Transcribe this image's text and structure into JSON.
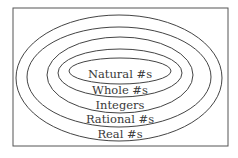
{
  "diagram": {
    "colors": {
      "stroke": "#444444",
      "text": "#3a3a3a",
      "background": "#ffffff"
    },
    "sets": [
      {
        "id": "natural",
        "label": "Natural #s"
      },
      {
        "id": "whole",
        "label": "Whole #s"
      },
      {
        "id": "integers",
        "label": "Integers"
      },
      {
        "id": "rational",
        "label": "Rational #s"
      },
      {
        "id": "real",
        "label": "Real #s"
      }
    ]
  }
}
